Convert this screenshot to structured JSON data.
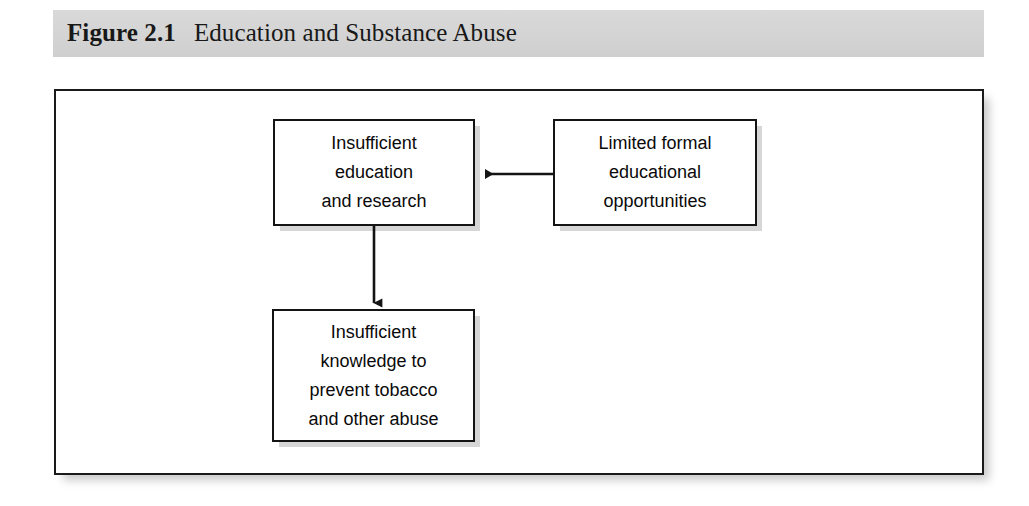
{
  "caption": {
    "label": "Figure 2.1",
    "title": "Education and Substance Abuse"
  },
  "figure": {
    "background_color": "#ffffff",
    "border_color": "#1a1a1a",
    "band_color": "#d6d6d6"
  },
  "diagram": {
    "type": "flowchart",
    "nodes": [
      {
        "id": "insufficient-education",
        "lines": [
          "Insufficient",
          "education",
          "and research"
        ],
        "x": 271,
        "y": 117,
        "width": 202,
        "height": 107
      },
      {
        "id": "limited-formal-education",
        "lines": [
          "Limited formal",
          "educational",
          "opportunities"
        ],
        "x": 551,
        "y": 117,
        "width": 204,
        "height": 107
      },
      {
        "id": "insufficient-knowledge",
        "lines": [
          "Insufficient",
          "knowledge to",
          "prevent tobacco",
          "and other abuse"
        ],
        "x": 270,
        "y": 307,
        "width": 203,
        "height": 133
      }
    ],
    "edges": [
      {
        "id": "edge-limited-to-insufficient-education",
        "from": "limited-formal-education",
        "to": "insufficient-education",
        "direction": "left",
        "style": "solid-arrow"
      },
      {
        "id": "edge-insufficient-education-to-knowledge",
        "from": "insufficient-education",
        "to": "insufficient-knowledge",
        "direction": "down",
        "style": "solid-arrow"
      }
    ]
  }
}
